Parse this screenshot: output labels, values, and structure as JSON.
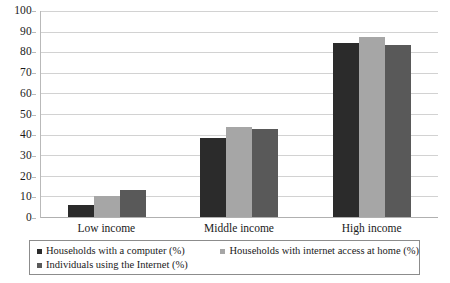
{
  "chart_data": {
    "type": "bar",
    "title": "",
    "subtitle": "",
    "xlabel": "",
    "ylabel": "",
    "categories": [
      "Low income",
      "Middle income",
      "High income"
    ],
    "series": [
      {
        "name": "Households with a computer (%)",
        "color": "#2b2b2b",
        "values": [
          6,
          38,
          84
        ]
      },
      {
        "name": "Households with internet access at home (%)",
        "color": "#a6a6a6",
        "values": [
          10,
          43.5,
          87
        ]
      },
      {
        "name": "Individuals using the Internet (%)",
        "color": "#595959",
        "values": [
          13,
          42.5,
          83
        ]
      }
    ],
    "ylim": [
      0,
      100
    ],
    "ytick_labels": [
      "0",
      "10",
      "20",
      "30",
      "40",
      "50",
      "60",
      "70",
      "80",
      "90",
      "100"
    ],
    "ytick_values": [
      0,
      10,
      20,
      30,
      40,
      50,
      60,
      70,
      80,
      90,
      100
    ],
    "grid": true,
    "grid_axis": "y",
    "legend_position": "bottom",
    "legend_entries": [
      "Households with a computer (%)",
      "Households with internet access at home (%)",
      "Individuals using the Internet (%)"
    ],
    "annotations": [],
    "colors": {
      "series_1": "#2b2b2b",
      "series_2": "#a6a6a6",
      "series_3": "#595959",
      "gridline": "#d2d2d2",
      "axis": "#b9b9b9",
      "legend_border": "#8c8c8c",
      "background": "#ffffff",
      "text": "#1a1a1a"
    }
  }
}
